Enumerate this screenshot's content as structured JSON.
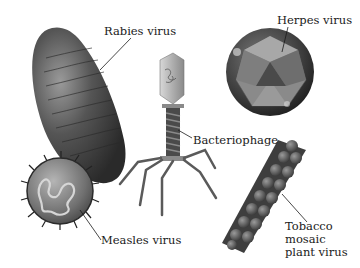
{
  "figure": {
    "labels": {
      "rabies": "Rabies virus",
      "herpes": "Herpes virus",
      "bacteriophage": "Bacteriophage",
      "measles": "Measles virus",
      "tobacco_line1": "Tobacco",
      "tobacco_line2": "mosaic",
      "tobacco_line3": "plant virus"
    },
    "colors": {
      "background": "#ffffff",
      "virus_dark": "#3a3a3a",
      "virus_mid": "#7a7a7a",
      "virus_light": "#c8c8c8",
      "leader_line": "#1a1a1a"
    }
  }
}
